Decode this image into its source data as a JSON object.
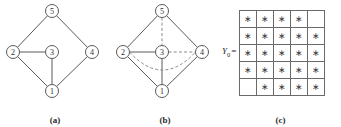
{
  "figure": {
    "captions": {
      "a": "(a)",
      "b": "(b)",
      "c": "(c)"
    }
  },
  "graph_a": {
    "nodes": [
      {
        "id": "5",
        "label": "5",
        "x": 52,
        "y": 11
      },
      {
        "id": "2",
        "label": "2",
        "x": 13,
        "y": 52
      },
      {
        "id": "3",
        "label": "3",
        "x": 52,
        "y": 52
      },
      {
        "id": "4",
        "label": "4",
        "x": 92,
        "y": 52
      },
      {
        "id": "1",
        "label": "1",
        "x": 52,
        "y": 91
      }
    ],
    "solid_edges": [
      [
        "5",
        "2"
      ],
      [
        "5",
        "4"
      ],
      [
        "2",
        "3"
      ],
      [
        "2",
        "1"
      ],
      [
        "3",
        "1"
      ],
      [
        "1",
        "4"
      ]
    ],
    "dashed_edges": [],
    "dashed_arcs": []
  },
  "graph_b": {
    "nodes": [
      {
        "id": "5",
        "label": "5",
        "x": 52,
        "y": 11
      },
      {
        "id": "2",
        "label": "2",
        "x": 13,
        "y": 52
      },
      {
        "id": "3",
        "label": "3",
        "x": 52,
        "y": 52
      },
      {
        "id": "4",
        "label": "4",
        "x": 92,
        "y": 52
      },
      {
        "id": "1",
        "label": "1",
        "x": 52,
        "y": 91
      }
    ],
    "solid_edges": [
      [
        "5",
        "2"
      ],
      [
        "5",
        "4"
      ],
      [
        "2",
        "3"
      ],
      [
        "2",
        "1"
      ],
      [
        "3",
        "1"
      ],
      [
        "1",
        "4"
      ]
    ],
    "dashed_edges": [
      [
        "5",
        "3"
      ],
      [
        "3",
        "4"
      ]
    ],
    "dashed_arcs": [
      {
        "from": "2",
        "to": "4",
        "sag": 18
      }
    ]
  },
  "matrix": {
    "label_symbol": "Y",
    "label_subscript": "0",
    "label_equals": "=",
    "star_glyph": "∗",
    "rows": [
      [
        "*",
        "*",
        "*",
        "*",
        ""
      ],
      [
        "*",
        "*",
        "*",
        "*",
        "*"
      ],
      [
        "*",
        "*",
        "*",
        "*",
        "*"
      ],
      [
        "*",
        "*",
        "*",
        "*",
        "*"
      ],
      [
        "",
        "*",
        "*",
        "*",
        "*"
      ]
    ]
  },
  "colors": {
    "edge_solid": "#5a5a5a",
    "edge_dashed": "#8a8a8a",
    "grid_line": "#6a6a6a",
    "text": "#2b2b2b",
    "background": "#ffffff"
  }
}
